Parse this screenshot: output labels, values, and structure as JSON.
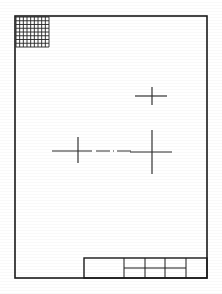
{
  "document": {
    "kind": "engineering-drawing-sheet",
    "orientation": "portrait",
    "sheet_width_px": 222,
    "sheet_height_px": 294,
    "background_color": "#ffffff",
    "ink_color": "#1a1a1a"
  },
  "border": {
    "name": "drawing-frame",
    "x": 15,
    "y": 16,
    "width": 192,
    "height": 262,
    "stroke_width": 1.6
  },
  "hatch_patch": {
    "name": "corner-hatch-square",
    "x": 16,
    "y": 17,
    "width": 33,
    "height": 30,
    "columns": 9,
    "rows": 8,
    "stroke_color": "#242424",
    "description": "cross-hatched grid block in upper-left corner"
  },
  "center_marks": [
    {
      "id": "mark-upper-right",
      "cx": 152,
      "cy": 96,
      "arm_left": 17,
      "arm_right": 15,
      "arm_up": 9,
      "arm_down": 9
    },
    {
      "id": "mark-lower-left",
      "cx": 78,
      "cy": 151,
      "arm_left": 26,
      "arm_right": 14,
      "arm_up": 14,
      "arm_down": 12
    },
    {
      "id": "mark-lower-right",
      "cx": 152,
      "cy": 152,
      "arm_left": 22,
      "arm_right": 20,
      "arm_up": 22,
      "arm_down": 22
    }
  ],
  "center_link": {
    "name": "dash-dot-centerline",
    "x_start": 96,
    "x_end": 134,
    "y": 151,
    "dash_pattern": "14 3 1 3"
  },
  "title_block": {
    "name": "title-block",
    "x": 84,
    "y": 258,
    "width": 123,
    "height": 20,
    "vertical_dividers": [
      124,
      145,
      165,
      186
    ],
    "horizontal_divider_y": 268,
    "horizontal_divider_x_start": 124,
    "horizontal_divider_x_end": 186,
    "cells": [
      {
        "id": "cell-main",
        "label": ""
      },
      {
        "id": "cell-r1c1",
        "label": ""
      },
      {
        "id": "cell-r1c2",
        "label": ""
      },
      {
        "id": "cell-r1c3",
        "label": ""
      },
      {
        "id": "cell-r2c1",
        "label": ""
      },
      {
        "id": "cell-r2c2",
        "label": ""
      },
      {
        "id": "cell-r2c3",
        "label": ""
      },
      {
        "id": "cell-right",
        "label": ""
      }
    ]
  },
  "notes": {
    "visible_text": "",
    "description": "Blank scanned technical drawing sheet: outer frame, hatched corner block, three center marks with dash-dot centerlines, and an empty subdivided title block."
  }
}
